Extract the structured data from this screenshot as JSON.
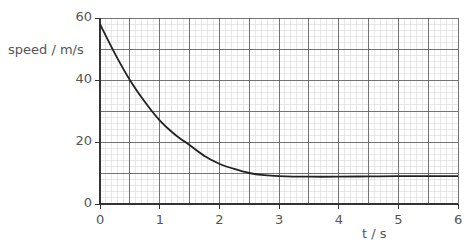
{
  "chart_data": {
    "type": "line",
    "title": "",
    "xlabel": "t / s",
    "ylabel": "speed / m/s",
    "xlim": [
      0,
      6
    ],
    "ylim": [
      0,
      60
    ],
    "x_ticks": [
      0,
      1,
      2,
      3,
      4,
      5,
      6
    ],
    "y_ticks": [
      0,
      20,
      40,
      60
    ],
    "grid": {
      "major_x": 0.5,
      "major_y": 10,
      "minor_x": 0.1,
      "minor_y": 2
    },
    "legend": null,
    "series": [
      {
        "name": "speed",
        "x": [
          0,
          0.25,
          0.5,
          0.75,
          1.0,
          1.25,
          1.5,
          1.75,
          2.0,
          2.25,
          2.5,
          2.75,
          3.0,
          3.5,
          4.0,
          4.5,
          5.0,
          5.5,
          6.0
        ],
        "y": [
          58,
          48.5,
          40,
          33,
          27,
          22.5,
          19,
          15.5,
          13,
          11.3,
          10,
          9.3,
          9,
          8.8,
          8.8,
          8.9,
          9,
          9,
          9
        ]
      }
    ],
    "line_color": "#222222"
  }
}
